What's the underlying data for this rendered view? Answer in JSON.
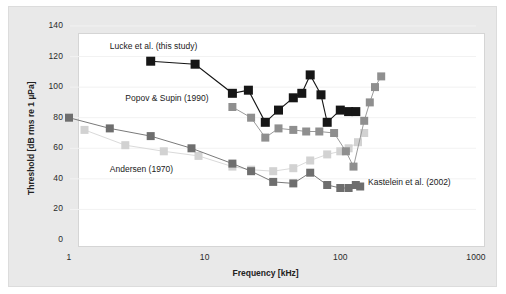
{
  "chart_data": {
    "type": "line",
    "title": "",
    "xlabel": "Frequency [kHz]",
    "ylabel": "Threshold [dB rms re 1 µPa]",
    "xscale": "log",
    "xlim": [
      1,
      1000
    ],
    "ylim": [
      0,
      140
    ],
    "yticks": [
      0,
      20,
      40,
      60,
      80,
      100,
      120,
      140
    ],
    "xticks": [
      1,
      10,
      100,
      1000
    ],
    "xtick_labels": [
      "1",
      "10",
      "100",
      "1000"
    ],
    "ytick_labels": [
      "0",
      "20",
      "40",
      "60",
      "80",
      "100",
      "120",
      "140"
    ],
    "grid": "horizontal-faint",
    "legend": "in-plot text annotations",
    "marker": "square",
    "series": [
      {
        "name": "Lucke et al. (this study)",
        "color": "#161616",
        "line_color": "#161616",
        "marker_size": 9,
        "label_x": 2.0,
        "label_y": 126,
        "points": [
          [
            4.0,
            117
          ],
          [
            8.5,
            115
          ],
          [
            16.0,
            96
          ],
          [
            21.0,
            98
          ],
          [
            28.0,
            77
          ],
          [
            35.0,
            85
          ],
          [
            45.0,
            93
          ],
          [
            52.0,
            96
          ],
          [
            60.0,
            108
          ],
          [
            72.0,
            95
          ],
          [
            80.0,
            77
          ],
          [
            100.0,
            85
          ],
          [
            115.0,
            84
          ],
          [
            130.0,
            84
          ]
        ]
      },
      {
        "name": "Popov & Supin (1990)",
        "color": "#8f8f8f",
        "line_color": "#9a9a9a",
        "marker_size": 8,
        "label_x": 2.6,
        "label_y": 92,
        "points": [
          [
            16.0,
            87
          ],
          [
            22.0,
            80
          ],
          [
            28.0,
            67
          ],
          [
            35.0,
            73
          ],
          [
            45.0,
            72
          ],
          [
            56.0,
            71
          ],
          [
            70.0,
            71
          ],
          [
            90.0,
            70
          ],
          [
            110.0,
            58
          ],
          [
            125.0,
            48
          ],
          [
            150.0,
            78
          ],
          [
            165.0,
            90
          ],
          [
            180.0,
            100
          ],
          [
            200.0,
            107
          ]
        ]
      },
      {
        "name": "Andersen (1970)",
        "color": "#6e6e6e",
        "line_color": "#7a7a7a",
        "marker_size": 8,
        "label_x": 2.0,
        "label_y": 46,
        "points": [
          [
            1.0,
            80
          ],
          [
            2.0,
            73
          ],
          [
            4.0,
            68
          ],
          [
            8.0,
            60
          ],
          [
            16.0,
            50
          ],
          [
            22.0,
            45
          ],
          [
            32.0,
            38
          ],
          [
            45.0,
            37
          ],
          [
            60.0,
            44
          ],
          [
            80.0,
            36
          ],
          [
            100.0,
            34
          ],
          [
            115.0,
            34
          ],
          [
            130.0,
            36
          ],
          [
            140.0,
            35
          ]
        ]
      },
      {
        "name": "Kastelein et al. (2002)",
        "color": "#d2d2d2",
        "line_color": "#dadada",
        "marker_size": 8,
        "label_x": 160,
        "label_y": 37,
        "points": [
          [
            1.3,
            72
          ],
          [
            2.6,
            62
          ],
          [
            5.0,
            58
          ],
          [
            9.0,
            55
          ],
          [
            16.0,
            48
          ],
          [
            22.0,
            46
          ],
          [
            32.0,
            45
          ],
          [
            45.0,
            47
          ],
          [
            60.0,
            52
          ],
          [
            80.0,
            56
          ],
          [
            100.0,
            58
          ],
          [
            115.0,
            60
          ],
          [
            135.0,
            64
          ],
          [
            150.0,
            70
          ]
        ]
      }
    ]
  }
}
